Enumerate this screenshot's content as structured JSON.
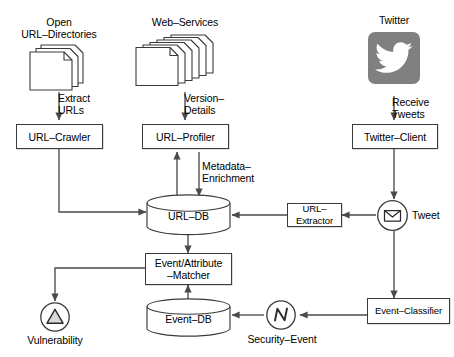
{
  "diagram": {
    "type": "flow-diagram",
    "colors": {
      "stroke": "#3a3a3a",
      "arrow": "#4a4a4a",
      "twitter_tile": "#808080",
      "twitter_bird": "#ffffff",
      "background": "#ffffff",
      "doc_fill": "#ffffff",
      "shadow": "rgba(0,0,0,0.22)"
    },
    "sources": {
      "open_url_directories": "Open\nURL–Directories",
      "web_services": "Web–Services",
      "twitter": "Twitter"
    },
    "boxes": {
      "url_crawler": "URL–Crawler",
      "url_profiler": "URL–Profiler",
      "twitter_client": "Twitter–Client",
      "url_extractor": "URL–Extractor",
      "event_attribute_matcher": "Event/Attribute\n–Matcher",
      "event_classifier": "Event–Classifier"
    },
    "databases": {
      "url_db": "URL–DB",
      "event_db": "Event–DB"
    },
    "markers": {
      "tweet": "Tweet",
      "security_event": "Security–Event",
      "vulnerability": "Vulnerability"
    },
    "edge_labels": {
      "extract_urls": "Extract\nURLs",
      "version_details": "Version–\nDetails",
      "receive_tweets": "Receive\nTweets",
      "metadata_enrichment": "Metadata–\nEnrichment"
    },
    "icons": {
      "twitter": "twitter-bird-icon",
      "tweet": "envelope-icon",
      "security_event": "activity-pulse-icon",
      "vulnerability": "warning-triangle-icon",
      "documents": "document-stack-icon",
      "database": "database-cylinder-icon"
    }
  }
}
